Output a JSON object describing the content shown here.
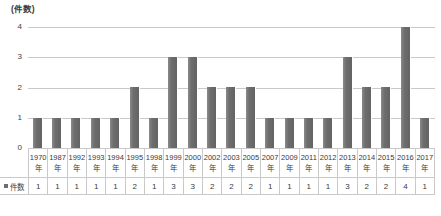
{
  "chart_data": {
    "type": "bar",
    "title": "",
    "subtitle": "",
    "xlabel": "",
    "ylabel": "(件数)",
    "ylim": [
      0,
      4
    ],
    "ytick_labels": [
      "4",
      "3",
      "2",
      "1",
      "0"
    ],
    "ytick_values": [
      4,
      3,
      2,
      1,
      0
    ],
    "grid": true,
    "legend_position": "table-row-header",
    "categories": [
      "1970年",
      "1987年",
      "1992年",
      "1993年",
      "1994年",
      "1995年",
      "1998年",
      "1999年",
      "2000年",
      "2002年",
      "2003年",
      "2005年",
      "2007年",
      "2009年",
      "2011年",
      "2012年",
      "2013年",
      "2014年",
      "2015年",
      "2016年",
      "2017年"
    ],
    "category_years": [
      "1970",
      "1987",
      "1992",
      "1993",
      "1994",
      "1995",
      "1998",
      "1999",
      "2000",
      "2002",
      "2003",
      "2005",
      "2007",
      "2009",
      "2011",
      "2012",
      "2013",
      "2014",
      "2015",
      "2016",
      "2017"
    ],
    "category_suffix": "年",
    "series": [
      {
        "name": "件数",
        "color": "#6e6e6e",
        "values": [
          1,
          1,
          1,
          1,
          1,
          2,
          1,
          3,
          3,
          2,
          2,
          2,
          1,
          1,
          1,
          1,
          3,
          2,
          2,
          4,
          1
        ]
      }
    ]
  },
  "table": {
    "series_row_label": "件数"
  },
  "colors": {
    "bar": "#6e6e6e",
    "gridline": "#c9c9c9",
    "text": "#3a3a3a"
  }
}
